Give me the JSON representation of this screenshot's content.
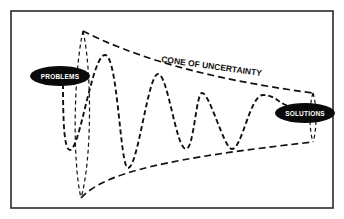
{
  "diagram": {
    "title": "CONE OF UNCERTAINTY",
    "start_label": "PROBLEMS",
    "end_label": "SOLUTIONS",
    "colors": {
      "background": "#ffffff",
      "line": "#111111",
      "pill_fill": "#0a0a0a",
      "pill_text": "#ffffff"
    }
  }
}
